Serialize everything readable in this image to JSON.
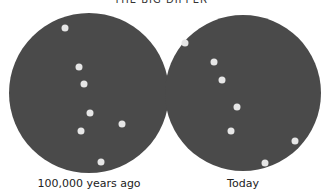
{
  "title": "THE BIG DIPPER",
  "colors": {
    "sky": "#4a4a4a",
    "star": "#e6e6e6",
    "background": "#ffffff"
  },
  "panels": [
    {
      "caption": "100,000 years ago",
      "circle": {
        "cx": 89,
        "cy": 93,
        "r": 80
      },
      "stars": [
        [
          65,
          28
        ],
        [
          79,
          67
        ],
        [
          84,
          84
        ],
        [
          90,
          113
        ],
        [
          122,
          124
        ],
        [
          81,
          131
        ],
        [
          101,
          162
        ]
      ]
    },
    {
      "caption": "Today",
      "circle": {
        "cx": 243,
        "cy": 93,
        "r": 78
      },
      "stars": [
        [
          185,
          43
        ],
        [
          214,
          62
        ],
        [
          222,
          80
        ],
        [
          237,
          107
        ],
        [
          231,
          131
        ],
        [
          295,
          141
        ],
        [
          265,
          163
        ]
      ]
    }
  ]
}
